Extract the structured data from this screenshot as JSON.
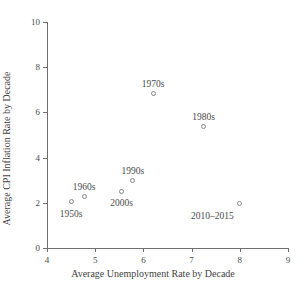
{
  "chart_data": {
    "type": "scatter",
    "title": "",
    "xlabel": "Average Unemployment Rate by Decade",
    "ylabel": "Average CPI Inflation Rate by Decade",
    "xlim": [
      4,
      9
    ],
    "ylim": [
      0,
      10
    ],
    "xticks": [
      4,
      5,
      6,
      7,
      8,
      9
    ],
    "yticks": [
      0,
      2,
      4,
      6,
      8,
      10
    ],
    "xticklabels": [
      "4",
      "5",
      "6",
      "7",
      "8",
      "9"
    ],
    "yticklabels": [
      "0",
      "2",
      "4",
      "6",
      "8",
      "10"
    ],
    "grid": false,
    "legend": "none",
    "marker": "open-circle",
    "marker_color": "#8a8a8a",
    "points": [
      {
        "label": "1950s",
        "x": 4.5,
        "y": 2.05,
        "label_dx": 0,
        "label_dy": 13,
        "label_align": "center"
      },
      {
        "label": "1960s",
        "x": 4.77,
        "y": 2.27,
        "label_dx": 0,
        "label_dy": -9,
        "label_align": "center"
      },
      {
        "label": "1970s",
        "x": 6.2,
        "y": 6.82,
        "label_dx": 0,
        "label_dy": -9,
        "label_align": "center"
      },
      {
        "label": "1980s",
        "x": 7.25,
        "y": 5.37,
        "label_dx": 0,
        "label_dy": -9,
        "label_align": "center"
      },
      {
        "label": "1990s",
        "x": 5.78,
        "y": 2.97,
        "label_dx": 0,
        "label_dy": -9,
        "label_align": "center"
      },
      {
        "label": "2000s",
        "x": 5.55,
        "y": 2.52,
        "label_dx": 0,
        "label_dy": 13,
        "label_align": "center"
      },
      {
        "label": "2010–2015",
        "x": 8.0,
        "y": 1.95,
        "label_dx": -6,
        "label_dy": 13,
        "label_align": "right"
      }
    ]
  },
  "axis_color": "#6e6e6e",
  "text_color": "#4a4a4a"
}
